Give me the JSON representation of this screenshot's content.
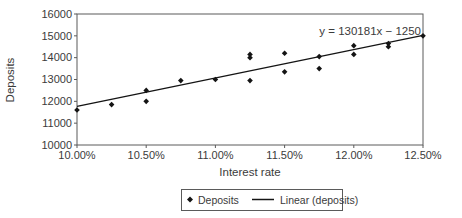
{
  "colors": {
    "background": "#ffffff",
    "ink": "#141414",
    "text": "#3b3b3b",
    "axis": "#5a5a5a"
  },
  "chart_data": {
    "type": "scatter",
    "title": "",
    "xlabel": "Interest rate",
    "ylabel": "Deposits",
    "grid": "none",
    "x_axis": {
      "min": 10.0,
      "max": 12.5,
      "unit": "%",
      "ticks": [
        {
          "value": 10.0,
          "label": "10.00%"
        },
        {
          "value": 10.5,
          "label": "10.50%"
        },
        {
          "value": 11.0,
          "label": "11.00%"
        },
        {
          "value": 11.5,
          "label": "11.50%"
        },
        {
          "value": 12.0,
          "label": "12.00%"
        },
        {
          "value": 12.5,
          "label": "12.50%"
        }
      ]
    },
    "y_axis": {
      "min": 10000,
      "max": 16000,
      "ticks": [
        {
          "value": 10000,
          "label": "10000"
        },
        {
          "value": 11000,
          "label": "11000"
        },
        {
          "value": 12000,
          "label": "12000"
        },
        {
          "value": 13000,
          "label": "13000"
        },
        {
          "value": 14000,
          "label": "14000"
        },
        {
          "value": 15000,
          "label": "15000"
        },
        {
          "value": 16000,
          "label": "16000"
        }
      ]
    },
    "series": [
      {
        "name": "Deposits",
        "marker": "diamond",
        "points": [
          [
            10.0,
            11600
          ],
          [
            10.25,
            11850
          ],
          [
            10.5,
            12000
          ],
          [
            10.5,
            12500
          ],
          [
            10.75,
            12950
          ],
          [
            11.0,
            13000
          ],
          [
            11.25,
            12950
          ],
          [
            11.25,
            14000
          ],
          [
            11.25,
            14150
          ],
          [
            11.5,
            13350
          ],
          [
            11.5,
            14200
          ],
          [
            11.75,
            13500
          ],
          [
            11.75,
            14050
          ],
          [
            12.0,
            14150
          ],
          [
            12.0,
            14550
          ],
          [
            12.25,
            14500
          ],
          [
            12.25,
            14650
          ],
          [
            12.5,
            15000
          ]
        ]
      }
    ],
    "trendline": {
      "name": "Linear (deposits)",
      "equation": "y = 130181x − 1250",
      "slope": 130181,
      "intercept": -1250,
      "x_domain_decimal": [
        0.1,
        0.125
      ]
    },
    "legend": {
      "position": "bottom-center",
      "border": true,
      "entries": [
        "Deposits",
        "Linear (deposits)"
      ]
    }
  }
}
